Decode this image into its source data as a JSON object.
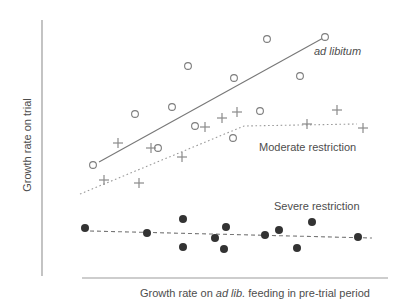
{
  "window": {
    "width": 410,
    "height": 303,
    "background": "#ffffff"
  },
  "chart_data": {
    "type": "scatter",
    "title": "",
    "ylabel": "Growth rate on trial",
    "xlabel_prefix": "Growth rate on ",
    "xlabel_italic": "ad lib.",
    "xlabel_suffix": " feeding in pre-trial period",
    "text_color": "#4d4d4d",
    "axes": {
      "ticks": "none",
      "grid": false,
      "color": "#9c9c9c",
      "y_axis_px": {
        "x": 42,
        "y1": 20,
        "y2": 276
      },
      "x_axis_px": {
        "y": 278,
        "x1": 82,
        "x2": 388
      }
    },
    "legend": "inline text labels beside each trend line",
    "series": [
      {
        "name": "ad libitum",
        "label_style": "italic",
        "marker": "open-circle",
        "marker_color": "#7d7d7d",
        "trend_style": "solid",
        "trend_color": "#787878",
        "points_px": [
          [
            93,
            165
          ],
          [
            135,
            114
          ],
          [
            158,
            148
          ],
          [
            172,
            107
          ],
          [
            188,
            66
          ],
          [
            195,
            126
          ],
          [
            233,
            138
          ],
          [
            234,
            78
          ],
          [
            260,
            111
          ],
          [
            267,
            39
          ],
          [
            300,
            76
          ],
          [
            325,
            37
          ]
        ],
        "trend_px": [
          [
            99,
            162
          ],
          [
            325,
            37
          ]
        ]
      },
      {
        "name": "Moderate restriction",
        "label_style": "normal",
        "marker": "plus",
        "marker_color": "#8a8a8a",
        "trend_style": "dotted",
        "trend_color": "#9a9a9a",
        "points_px": [
          [
            104,
            180
          ],
          [
            118,
            143
          ],
          [
            139,
            183
          ],
          [
            151,
            148
          ],
          [
            182,
            157
          ],
          [
            205,
            127
          ],
          [
            222,
            118
          ],
          [
            237,
            112
          ],
          [
            307,
            124
          ],
          [
            337,
            110
          ],
          [
            363,
            128
          ]
        ],
        "trend_px": [
          [
            80,
            194
          ],
          [
            244,
            126
          ],
          [
            357,
            124
          ]
        ]
      },
      {
        "name": "Severe restriction",
        "label_style": "normal",
        "marker": "filled-circle",
        "marker_color": "#333333",
        "trend_style": "dashed",
        "trend_color": "#777777",
        "points_px": [
          [
            85,
            228
          ],
          [
            147,
            233
          ],
          [
            183,
            219
          ],
          [
            183,
            247
          ],
          [
            215,
            238
          ],
          [
            226,
            227
          ],
          [
            224,
            249
          ],
          [
            265,
            235
          ],
          [
            279,
            230
          ],
          [
            297,
            248
          ],
          [
            312,
            222
          ],
          [
            358,
            237
          ]
        ],
        "trend_px": [
          [
            90,
            231
          ],
          [
            372,
            238
          ]
        ]
      }
    ]
  }
}
